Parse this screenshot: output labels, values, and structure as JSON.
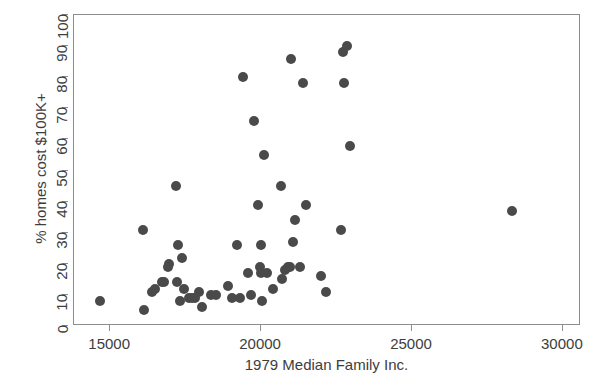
{
  "chart_data": {
    "type": "scatter",
    "title": "",
    "xlabel": "1979 Median Family Inc.",
    "ylabel": "% homes cost $100K+",
    "xlim": [
      13800,
      30600
    ],
    "ylim": [
      0,
      100
    ],
    "xticks": [
      15000,
      20000,
      25000,
      30000
    ],
    "xtick_labels": [
      "15000",
      "20000",
      "25000",
      "30000"
    ],
    "yticks": [
      0,
      10,
      20,
      30,
      40,
      50,
      60,
      70,
      80,
      90,
      100
    ],
    "ytick_labels": [
      "0",
      "10",
      "20",
      "30",
      "40",
      "50",
      "60",
      "70",
      "80",
      "90",
      "100"
    ],
    "grid": false,
    "legend": false,
    "marker": {
      "shape": "circle",
      "color": "#4a4a4a",
      "size_px": 10
    },
    "series": [
      {
        "name": "metro areas",
        "n_points": 57,
        "points": [
          [
            14650,
            8
          ],
          [
            16100,
            31
          ],
          [
            16120,
            5
          ],
          [
            16400,
            11
          ],
          [
            16480,
            12
          ],
          [
            16700,
            14
          ],
          [
            16780,
            14
          ],
          [
            16900,
            19
          ],
          [
            16950,
            20
          ],
          [
            17180,
            45
          ],
          [
            17200,
            14
          ],
          [
            17250,
            26
          ],
          [
            17300,
            8
          ],
          [
            17380,
            22
          ],
          [
            17450,
            12
          ],
          [
            17600,
            9
          ],
          [
            17700,
            9
          ],
          [
            17950,
            11
          ],
          [
            18050,
            6
          ],
          [
            18350,
            10
          ],
          [
            18900,
            13
          ],
          [
            19050,
            9
          ],
          [
            19200,
            26
          ],
          [
            19400,
            80
          ],
          [
            19550,
            17
          ],
          [
            19650,
            10
          ],
          [
            19750,
            66
          ],
          [
            19900,
            39
          ],
          [
            19950,
            19
          ],
          [
            19980,
            26
          ],
          [
            20000,
            17
          ],
          [
            20030,
            8
          ],
          [
            20100,
            55
          ],
          [
            20400,
            12
          ],
          [
            20650,
            45
          ],
          [
            20700,
            15
          ],
          [
            20780,
            18
          ],
          [
            20900,
            19
          ],
          [
            20950,
            19
          ],
          [
            21000,
            86
          ],
          [
            21050,
            27
          ],
          [
            21120,
            34
          ],
          [
            21400,
            78
          ],
          [
            21500,
            39
          ],
          [
            22000,
            16
          ],
          [
            22150,
            11
          ],
          [
            22650,
            31
          ],
          [
            22700,
            88
          ],
          [
            22750,
            78
          ],
          [
            22850,
            90
          ],
          [
            22950,
            58
          ],
          [
            28300,
            37
          ],
          [
            20200,
            17
          ],
          [
            21300,
            19
          ],
          [
            17800,
            9
          ],
          [
            18500,
            10
          ],
          [
            19300,
            9
          ]
        ]
      }
    ]
  }
}
